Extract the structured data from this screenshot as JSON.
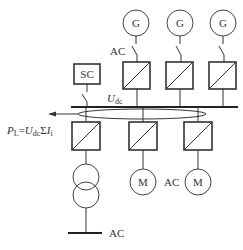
{
  "diagram": {
    "generators": [
      {
        "label": "G"
      },
      {
        "label": "G"
      },
      {
        "label": "G"
      }
    ],
    "motors": [
      {
        "label": "M"
      },
      {
        "label": "M"
      }
    ],
    "supercap": {
      "label": "SC"
    },
    "labels": {
      "ac_generator": "AC",
      "ac_motor": "AC",
      "ac_grid": "AC",
      "udc_main": "U",
      "udc_sub": "dc",
      "power_P": "P",
      "power_P_sub": "L",
      "power_eq": "=",
      "power_U": "U",
      "power_U_sub": "dc",
      "power_sum": "Σ",
      "power_I": "I",
      "power_I_sub": "i"
    }
  }
}
